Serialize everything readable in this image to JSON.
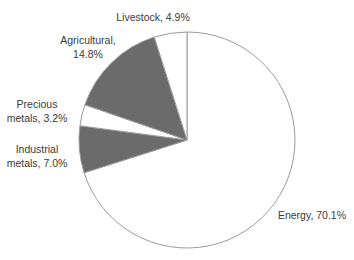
{
  "chart_data": {
    "type": "pie",
    "title": "",
    "start_angle": "12 o'clock",
    "direction": "clockwise",
    "legend": "none",
    "slices": [
      {
        "name": "Energy",
        "value": 70.1,
        "label_lines": [
          "Energy, 70.1%"
        ],
        "color": "#ffffff"
      },
      {
        "name": "Industrial metals",
        "value": 7.0,
        "label_lines": [
          "Industrial",
          "metals, 7.0%"
        ],
        "color": "#6b6b6b"
      },
      {
        "name": "Precious metals",
        "value": 3.2,
        "label_lines": [
          "Precious",
          "metals, 3.2%"
        ],
        "color": "#ffffff"
      },
      {
        "name": "Agricultural",
        "value": 14.8,
        "label_lines": [
          "Agricultural,",
          "14.8%"
        ],
        "color": "#6b6b6b"
      },
      {
        "name": "Livestock",
        "value": 4.9,
        "label_lines": [
          "Livestock, 4.9%"
        ],
        "color": "#ffffff"
      }
    ]
  }
}
